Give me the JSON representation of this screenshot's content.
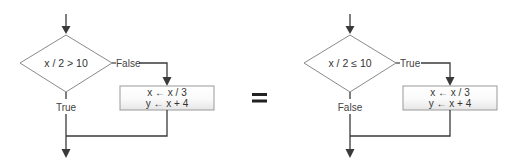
{
  "diagram": {
    "left": {
      "condition": "x / 2 > 10",
      "branch_right_label": "False",
      "branch_down_label": "True",
      "statements": [
        "x ← x / 3",
        "y ← x + 4"
      ]
    },
    "equals": "=",
    "right": {
      "condition": "x / 2 ≤ 10",
      "branch_right_label": "True",
      "branch_down_label": "False",
      "statements": [
        "x ← x / 3",
        "y ← x + 4"
      ]
    }
  },
  "colors": {
    "line": "#3a3a3a",
    "diamond_stroke": "#8a8a8a",
    "box_stroke": "#9a9a9a",
    "text": "#333333"
  }
}
